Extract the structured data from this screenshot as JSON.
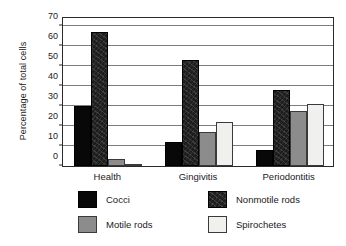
{
  "chart_data": {
    "type": "bar",
    "title": "",
    "subtitle": "",
    "xlabel": "",
    "ylabel": "Percentage of total cells",
    "ylim": [
      0,
      75
    ],
    "yticks": [
      0,
      10,
      20,
      30,
      40,
      50,
      60,
      70
    ],
    "ytick_labels": [
      "0",
      "10",
      "20",
      "30",
      "40",
      "50",
      "60",
      "70"
    ],
    "grid": "horizontal",
    "legend_position": "below",
    "categories": [
      "Health",
      "Gingivitis",
      "Periodontitis"
    ],
    "series": [
      {
        "name": "Cocci",
        "color": "#080808",
        "values": [
          30,
          12,
          8
        ]
      },
      {
        "name": "Nonmotile rods",
        "color": "#1c1c1c",
        "values": [
          67,
          53,
          38
        ]
      },
      {
        "name": "Motile rods",
        "color": "#8c8c8c",
        "values": [
          3.5,
          17,
          27.5
        ]
      },
      {
        "name": "Spirochetes",
        "color": "#f0f0ee",
        "values": [
          1,
          22,
          31
        ]
      }
    ]
  },
  "legend": {
    "entries": [
      {
        "label": "Cocci",
        "swatch": "cocci"
      },
      {
        "label": "Nonmotile rods",
        "swatch": "nonmotile"
      },
      {
        "label": "Motile rods",
        "swatch": "motile"
      },
      {
        "label": "Spirochetes",
        "swatch": "spiro"
      }
    ]
  }
}
